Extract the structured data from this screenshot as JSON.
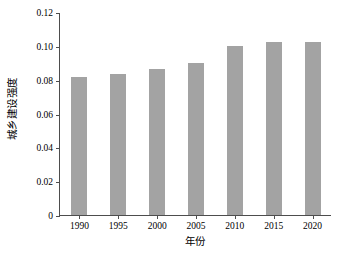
{
  "chart_data": {
    "type": "bar",
    "title": "",
    "xlabel": "年份",
    "ylabel": "城乡建设强度",
    "categories": [
      "1990",
      "1995",
      "2000",
      "2005",
      "2010",
      "2015",
      "2020"
    ],
    "values": [
      0.0815,
      0.0835,
      0.0865,
      0.09,
      0.1,
      0.1022,
      0.1022
    ],
    "series": [
      {
        "name": "城乡建设强度",
        "values": [
          0.0815,
          0.0835,
          0.0865,
          0.09,
          0.1,
          0.1022,
          0.1022
        ]
      }
    ],
    "ylim": [
      0,
      0.12
    ],
    "ytick_labels": [
      "0.12",
      "0.10",
      "0.08",
      "0.06",
      "0.04",
      "0.02",
      "0"
    ],
    "ytick_values": [
      0.12,
      0.1,
      0.08,
      0.06,
      0.04,
      0.02,
      0
    ],
    "grid": false,
    "legend": "none",
    "bar_color": "#a3a3a3",
    "axis_color": "#4d4d4d",
    "background_color": "#ffffff"
  }
}
